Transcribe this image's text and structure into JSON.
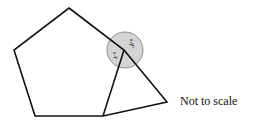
{
  "diagram": {
    "shapes": [
      "regular pentagon",
      "triangle"
    ],
    "angle_labels": {
      "x": "x°",
      "y": "y°"
    },
    "note": "Not to scale"
  }
}
